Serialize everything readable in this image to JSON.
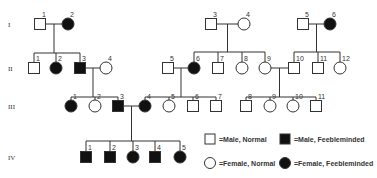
{
  "diagram": {
    "type": "pedigree",
    "trait": "Feebleminded",
    "generations": [
      {
        "label": "I",
        "y": 24
      },
      {
        "label": "II",
        "y": 68
      },
      {
        "label": "III",
        "y": 106
      },
      {
        "label": "IV",
        "y": 157
      }
    ],
    "individuals": [
      {
        "id": "I-1",
        "num": "1",
        "sex": "male",
        "affected": false,
        "x": 40,
        "gen": 0
      },
      {
        "id": "I-2",
        "num": "2",
        "sex": "female",
        "affected": true,
        "x": 68,
        "gen": 0
      },
      {
        "id": "I-3",
        "num": "3",
        "sex": "male",
        "affected": false,
        "x": 211,
        "gen": 0
      },
      {
        "id": "I-4",
        "num": "4",
        "sex": "female",
        "affected": false,
        "x": 244,
        "gen": 0
      },
      {
        "id": "I-5",
        "num": "5",
        "sex": "male",
        "affected": false,
        "x": 303,
        "gen": 0
      },
      {
        "id": "I-6",
        "num": "6",
        "sex": "female",
        "affected": true,
        "x": 330,
        "gen": 0
      },
      {
        "id": "II-1",
        "num": "1",
        "sex": "male",
        "affected": false,
        "x": 34,
        "gen": 1
      },
      {
        "id": "II-2",
        "num": "2",
        "sex": "female",
        "affected": true,
        "x": 56,
        "gen": 1
      },
      {
        "id": "II-3",
        "num": "3",
        "sex": "male",
        "affected": true,
        "x": 80,
        "gen": 1
      },
      {
        "id": "II-4",
        "num": "4",
        "sex": "female",
        "affected": false,
        "x": 106,
        "gen": 1
      },
      {
        "id": "II-5",
        "num": "5",
        "sex": "male",
        "affected": false,
        "x": 168,
        "gen": 1
      },
      {
        "id": "II-6",
        "num": "6",
        "sex": "female",
        "affected": true,
        "x": 194,
        "gen": 1
      },
      {
        "id": "II-7",
        "num": "7",
        "sex": "male",
        "affected": false,
        "x": 218,
        "gen": 1
      },
      {
        "id": "II-8",
        "num": "8",
        "sex": "female",
        "affected": false,
        "x": 242,
        "gen": 1
      },
      {
        "id": "II-9",
        "num": "9",
        "sex": "female",
        "affected": false,
        "x": 265,
        "gen": 1
      },
      {
        "id": "II-10",
        "num": "10",
        "sex": "male",
        "affected": false,
        "x": 294,
        "gen": 1
      },
      {
        "id": "II-11",
        "num": "11",
        "sex": "male",
        "affected": false,
        "x": 318,
        "gen": 1
      },
      {
        "id": "II-12",
        "num": "12",
        "sex": "female",
        "affected": false,
        "x": 340,
        "gen": 1
      },
      {
        "id": "III-1",
        "num": "1",
        "sex": "female",
        "affected": true,
        "x": 71,
        "gen": 2
      },
      {
        "id": "III-2",
        "num": "2",
        "sex": "female",
        "affected": false,
        "x": 95,
        "gen": 2
      },
      {
        "id": "III-3",
        "num": "3",
        "sex": "male",
        "affected": true,
        "x": 118,
        "gen": 2
      },
      {
        "id": "III-4",
        "num": "4",
        "sex": "female",
        "affected": true,
        "x": 145,
        "gen": 2
      },
      {
        "id": "III-5",
        "num": "5",
        "sex": "female",
        "affected": false,
        "x": 169,
        "gen": 2
      },
      {
        "id": "III-6",
        "num": "6",
        "sex": "male",
        "affected": false,
        "x": 193,
        "gen": 2
      },
      {
        "id": "III-7",
        "num": "7",
        "sex": "male",
        "affected": false,
        "x": 216,
        "gen": 2
      },
      {
        "id": "III-8",
        "num": "8",
        "sex": "male",
        "affected": false,
        "x": 246,
        "gen": 2
      },
      {
        "id": "III-9",
        "num": "9",
        "sex": "female",
        "affected": false,
        "x": 270,
        "gen": 2
      },
      {
        "id": "III-10",
        "num": "10",
        "sex": "female",
        "affected": false,
        "x": 293,
        "gen": 2
      },
      {
        "id": "III-11",
        "num": "11",
        "sex": "male",
        "affected": false,
        "x": 316,
        "gen": 2
      },
      {
        "id": "IV-1",
        "num": "1",
        "sex": "male",
        "affected": true,
        "x": 86,
        "gen": 3
      },
      {
        "id": "IV-2",
        "num": "2",
        "sex": "male",
        "affected": true,
        "x": 110,
        "gen": 3
      },
      {
        "id": "IV-3",
        "num": "3",
        "sex": "female",
        "affected": true,
        "x": 133,
        "gen": 3
      },
      {
        "id": "IV-4",
        "num": "4",
        "sex": "male",
        "affected": true,
        "x": 155,
        "gen": 3
      },
      {
        "id": "IV-5",
        "num": "5",
        "sex": "female",
        "affected": true,
        "x": 180,
        "gen": 3
      }
    ],
    "matings": [
      {
        "a": "I-1",
        "b": "I-2",
        "children": [
          "II-1",
          "II-2",
          "II-3"
        ],
        "sib_y": 53
      },
      {
        "a": "I-3",
        "b": "I-4",
        "children": [
          "II-6",
          "II-7",
          "II-8",
          "II-9"
        ],
        "sib_y": 52
      },
      {
        "a": "I-5",
        "b": "I-6",
        "children": [
          "II-10",
          "II-11",
          "II-12"
        ],
        "sib_y": 52
      },
      {
        "a": "II-3",
        "b": "II-4",
        "children": [
          "III-1",
          "III-2",
          "III-3"
        ],
        "sib_y": 97
      },
      {
        "a": "II-5",
        "b": "II-6",
        "children": [
          "III-4",
          "III-5",
          "III-6",
          "III-7"
        ],
        "sib_y": 97
      },
      {
        "a": "II-9",
        "b": "II-10",
        "children": [
          "III-8",
          "III-9",
          "III-10",
          "III-11"
        ],
        "sib_y": 97
      },
      {
        "a": "III-3",
        "b": "III-4",
        "children": [
          "IV-1",
          "IV-2",
          "IV-3",
          "IV-4",
          "IV-5"
        ],
        "sib_y": 141
      }
    ]
  },
  "legend": {
    "items": [
      {
        "shape": "square",
        "filled": false,
        "label": "=Male, Normal",
        "x": 210,
        "y": 139
      },
      {
        "shape": "square",
        "filled": true,
        "label": "=Male, Feebleminded",
        "x": 285,
        "y": 139
      },
      {
        "shape": "circle",
        "filled": false,
        "label": "=Female, Normal",
        "x": 210,
        "y": 163
      },
      {
        "shape": "circle",
        "filled": true,
        "label": "=Female, Feebleminded",
        "x": 285,
        "y": 163
      }
    ]
  },
  "colors": {
    "affected": "#111111",
    "normal_fill": "#ffffff",
    "stroke": "#333333"
  }
}
